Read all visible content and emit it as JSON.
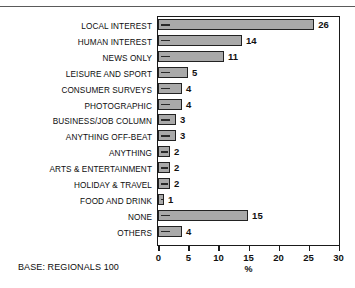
{
  "chart_data": {
    "type": "bar",
    "orientation": "horizontal",
    "title": "",
    "subtitle": "",
    "xlabel": "%",
    "ylabel": "",
    "xlim": [
      0,
      30
    ],
    "xticks": [
      0,
      5,
      10,
      15,
      20,
      25,
      30
    ],
    "xticklabels": [
      "0",
      "5",
      "10",
      "15",
      "20",
      "25",
      "30"
    ],
    "grid": false,
    "legend": false,
    "categories": [
      "LOCAL INTEREST",
      "HUMAN INTEREST",
      "NEWS ONLY",
      "LEISURE AND SPORT",
      "CONSUMER SURVEYS",
      "PHOTOGRAPHIC",
      "BUSINESS/JOB COLUMN",
      "ANYTHING OFF-BEAT",
      "ANYTHING",
      "ARTS & ENTERTAINMENT",
      "HOLIDAY & TRAVEL",
      "FOOD AND DRINK",
      "NONE",
      "OTHERS"
    ],
    "values": [
      26,
      14,
      11,
      5,
      4,
      4,
      3,
      3,
      2,
      2,
      2,
      1,
      15,
      4
    ],
    "datalabels": [
      "26",
      "14",
      "11",
      "5",
      "4",
      "4",
      "3",
      "3",
      "2",
      "2",
      "2",
      "1",
      "15",
      "4"
    ],
    "bar_color": "#a9a9a9",
    "bar_edge_color": "#222222",
    "axis_color": "#1a1a1a",
    "annotation": "BASE: REGIONALS 100"
  },
  "footnote": {
    "text": "BASE: REGIONALS 100"
  }
}
